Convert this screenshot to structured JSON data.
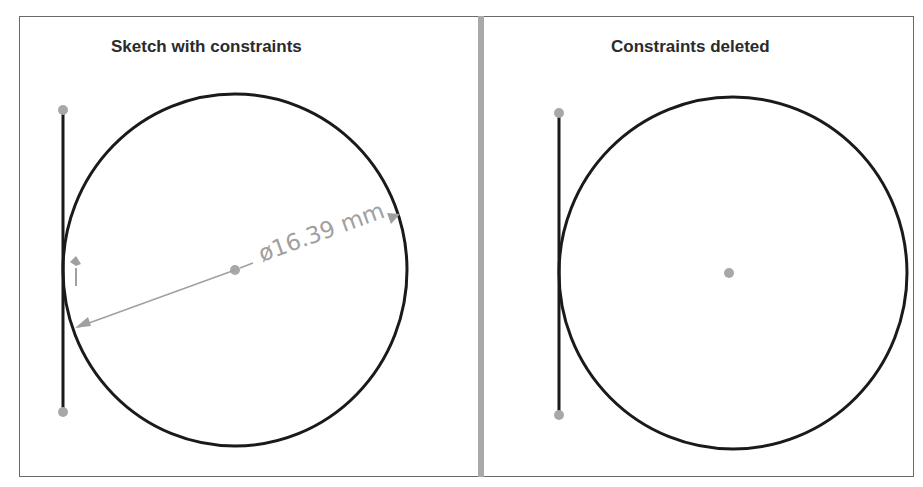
{
  "panels": {
    "left": {
      "title": "Sketch with constraints",
      "dimension_label": "ø16.39 mm",
      "elements": [
        "vertical-line",
        "circle",
        "center-point",
        "line-endpoints",
        "diameter-dimension",
        "tangent-constraint-marker"
      ]
    },
    "right": {
      "title": "Constraints deleted",
      "elements": [
        "vertical-line",
        "circle",
        "center-point",
        "line-endpoints"
      ]
    }
  },
  "colors": {
    "geometry": "#1a1a1a",
    "points": "#a8a8a8",
    "dimension": "#a0a0a0",
    "divider": "#a9a9a9",
    "frame": "#6a6a6a"
  }
}
